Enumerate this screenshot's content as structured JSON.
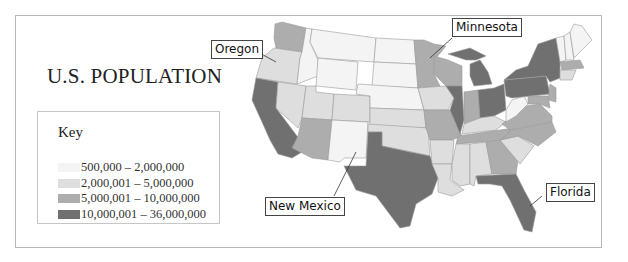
{
  "title": "U.S. POPULATION",
  "key": {
    "title": "Key",
    "items": [
      {
        "label": "500,000 – 2,000,000",
        "color": "#f4f4f4"
      },
      {
        "label": "2,000,001 – 5,000,000",
        "color": "#dedede"
      },
      {
        "label": "5,000,001 – 10,000,000",
        "color": "#adadad"
      },
      {
        "label": "10,000,001 – 36,000,000",
        "color": "#707070"
      }
    ]
  },
  "callouts": {
    "oregon": "Oregon",
    "minnesota": "Minnesota",
    "new_mexico": "New Mexico",
    "florida": "Florida"
  },
  "colors": {
    "frame_border": "#b9b9b9",
    "state_border": "#9a9a9a",
    "tier1": "#f4f4f4",
    "tier2": "#dedede",
    "tier3": "#adadad",
    "tier4": "#707070"
  }
}
